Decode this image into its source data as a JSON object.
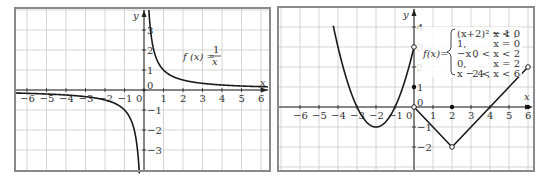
{
  "chart_data": [
    {
      "type": "line",
      "title": "f(x) = 1/x",
      "formula_label": {
        "lhs": "f (x) =",
        "num": "1",
        "den": "x"
      },
      "xlabel": "x",
      "ylabel": "y",
      "xlim": [
        -6,
        6
      ],
      "ylim": [
        -4,
        4
      ],
      "x_ticks": [
        "-6",
        "-5",
        "-4",
        "-3",
        "-2",
        "-1",
        "0",
        "1",
        "2",
        "3",
        "4",
        "5",
        "6"
      ],
      "y_ticks": [
        "3",
        "2",
        "1",
        "0",
        "-1",
        "-2",
        "-3"
      ],
      "grid": true,
      "series": [
        {
          "name": "1/x (x<0)",
          "points": [
            [
              -6.3,
              -0.16
            ],
            [
              -5,
              -0.2
            ],
            [
              -4,
              -0.25
            ],
            [
              -3,
              -0.33
            ],
            [
              -2,
              -0.5
            ],
            [
              -1.5,
              -0.67
            ],
            [
              -1,
              -1
            ],
            [
              -0.7,
              -1.43
            ],
            [
              -0.5,
              -2
            ],
            [
              -0.4,
              -2.5
            ],
            [
              -0.33,
              -3
            ],
            [
              -0.25,
              -4
            ]
          ]
        },
        {
          "name": "1/x (x>0)",
          "points": [
            [
              0.25,
              4
            ],
            [
              0.33,
              3
            ],
            [
              0.4,
              2.5
            ],
            [
              0.5,
              2
            ],
            [
              0.7,
              1.43
            ],
            [
              1,
              1
            ],
            [
              1.5,
              0.67
            ],
            [
              2,
              0.5
            ],
            [
              3,
              0.33
            ],
            [
              4,
              0.25
            ],
            [
              5,
              0.2
            ],
            [
              6.3,
              0.16
            ]
          ]
        }
      ]
    },
    {
      "type": "line",
      "title": "Piecewise function",
      "formula_label": {
        "lhs": "f(x)=",
        "cases": [
          {
            "expr": "(x+2)² − 1 ,",
            "cond": "x < 0"
          },
          {
            "expr": "1,",
            "cond": "x = 0"
          },
          {
            "expr": "−x ,",
            "cond": "0 < x < 2"
          },
          {
            "expr": "0,",
            "cond": "x = 2"
          },
          {
            "expr": "x − 4 ,",
            "cond": "2 < x < 6"
          }
        ]
      },
      "xlabel": "x",
      "ylabel": "y",
      "xlim": [
        -6,
        6
      ],
      "ylim": [
        -3,
        5
      ],
      "x_ticks": [
        "-6",
        "-5",
        "-4",
        "-3",
        "-2",
        "-1",
        "0",
        "1",
        "2",
        "3",
        "4",
        "5",
        "6"
      ],
      "y_ticks": [
        "4",
        "3",
        "2",
        "1",
        "0",
        "-1",
        "-2"
      ],
      "grid": true,
      "series": [
        {
          "name": "(x+2)^2-1, x<0",
          "points": [
            [
              -4.25,
              4.06
            ],
            [
              -4,
              3
            ],
            [
              -3.5,
              1.25
            ],
            [
              -3,
              0
            ],
            [
              -2.5,
              -0.75
            ],
            [
              -2,
              -1
            ],
            [
              -1.5,
              -0.75
            ],
            [
              -1,
              0
            ],
            [
              -0.5,
              1.25
            ],
            [
              0,
              3
            ]
          ]
        },
        {
          "name": "-x, 0<x<2",
          "points": [
            [
              0,
              0
            ],
            [
              2,
              -2
            ]
          ]
        },
        {
          "name": "x-4, 2<x<6",
          "points": [
            [
              2,
              -2
            ],
            [
              6,
              2
            ]
          ]
        }
      ],
      "open_points": [
        [
          0,
          3
        ],
        [
          0,
          0
        ],
        [
          2,
          -2
        ],
        [
          6,
          2
        ]
      ],
      "closed_points": [
        [
          0,
          1
        ],
        [
          2,
          0
        ],
        [
          6,
          0
        ]
      ]
    }
  ]
}
